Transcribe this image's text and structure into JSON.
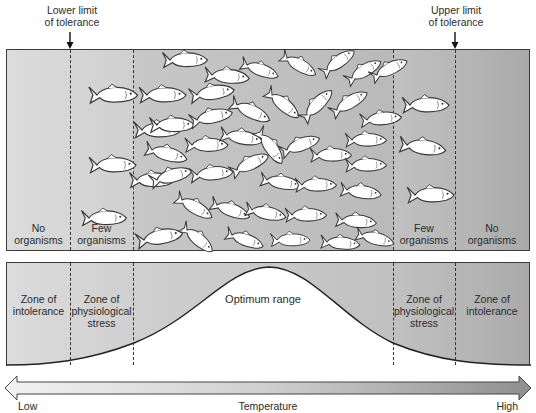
{
  "limits": {
    "lower": {
      "line1": "Lower limit",
      "line2": "of tolerance"
    },
    "upper": {
      "line1": "Upper limit",
      "line2": "of tolerance"
    }
  },
  "top_panel": {
    "zones": [
      {
        "line1": "No",
        "line2": "organisms"
      },
      {
        "line1": "Few",
        "line2": "organisms"
      },
      {
        "line1": "Few",
        "line2": "organisms"
      },
      {
        "line1": "No",
        "line2": "organisms"
      }
    ],
    "fish_icon": "fish-icon"
  },
  "bottom_panel": {
    "left_intolerance": {
      "line1": "Zone of",
      "line2": "intolerance"
    },
    "left_stress": {
      "line1": "Zone of",
      "line2": "physiological",
      "line3": "stress"
    },
    "optimum": "Optimum range",
    "right_stress": {
      "line1": "Zone of",
      "line2": "physiological",
      "line3": "stress"
    },
    "right_intolerance": {
      "line1": "Zone of",
      "line2": "intolerance"
    }
  },
  "axis": {
    "low": "Low",
    "title": "Temperature",
    "high": "High"
  },
  "colors": {
    "outline": "#333333",
    "fish_fill": "#ffffff",
    "panel_light": "#dcdcdc",
    "panel_dark": "#a9a9a9"
  }
}
